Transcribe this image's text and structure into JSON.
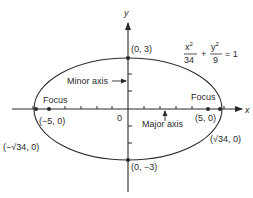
{
  "diagram": {
    "equation": {
      "x_num": "x",
      "x_exp": "2",
      "x_den": "34",
      "plus": "+",
      "y_num": "y",
      "y_exp": "2",
      "y_den": "9",
      "equals": "= 1"
    },
    "axes": {
      "x_label": "x",
      "y_label": "y",
      "origin_label": "0"
    },
    "points": {
      "top": "(0, 3)",
      "bottom": "(0, −3)",
      "focus_left": "(−5, 0)",
      "focus_right": "(5, 0)",
      "vertex_left": "(−√34, 0)",
      "vertex_right": "(√34, 0)"
    },
    "annotations": {
      "minor_axis": "Minor axis",
      "major_axis": "Major axis",
      "focus_left": "Focus",
      "focus_right": "Focus"
    },
    "colors": {
      "ink": "#2a2a2a",
      "background": "#ffffff"
    }
  }
}
